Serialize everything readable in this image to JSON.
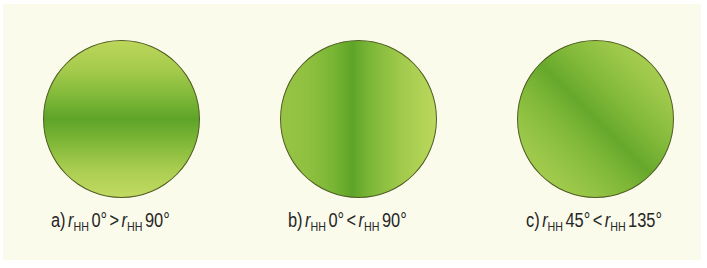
{
  "figures": [
    {
      "id": "a",
      "prefix": "a)",
      "var1": "r",
      "sub1": "HH",
      "val1": "0°",
      "op": ">",
      "var2": "r",
      "sub2": "HH",
      "val2": "90°",
      "band_orientation": "horizontal"
    },
    {
      "id": "b",
      "prefix": "b)",
      "var1": "r",
      "sub1": "HH",
      "val1": "0°",
      "op": "<",
      "var2": "r",
      "sub2": "HH",
      "val2": "90°",
      "band_orientation": "vertical"
    },
    {
      "id": "c",
      "prefix": "c)",
      "var1": "r",
      "sub1": "HH",
      "val1": "45°",
      "op": "<",
      "var2": "r",
      "sub2": "HH",
      "val2": "135°",
      "band_orientation": "diagonal-135"
    }
  ],
  "colors": {
    "background": "#fbfbec",
    "band_dark": "#5ea428",
    "edge_light": "#bcd75c",
    "outline": "#4f5d22",
    "text": "#262626"
  }
}
